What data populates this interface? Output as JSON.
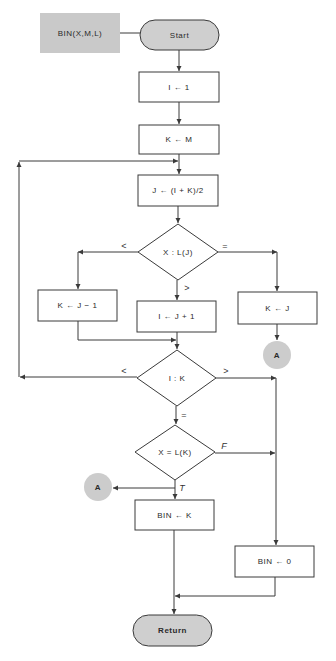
{
  "colors": {
    "line": "#3a3a3a",
    "terminal_fill": "#cfcfcf",
    "annotation_fill": "#c9c9c9",
    "connector_fill": "#cccccc",
    "box_fill": "#ffffff"
  },
  "flowchart": {
    "annotation": {
      "label": "BIN(X,M,L)"
    },
    "start": {
      "label": "Start"
    },
    "init_i": {
      "label": "I ← 1"
    },
    "init_k": {
      "label": "K ← M"
    },
    "compute_j": {
      "label": "J ← (I + K)/2"
    },
    "decision_compare": {
      "label": "X : L(J)",
      "branch_less": "<",
      "branch_greater": ">",
      "branch_equal": "="
    },
    "set_k_minus": {
      "label": "K ← J − 1"
    },
    "set_i_plus": {
      "label": "I ← J + 1"
    },
    "set_k_j": {
      "label": "K ← J"
    },
    "connector_right": {
      "label": "A"
    },
    "decision_ik": {
      "label": "I : K",
      "branch_less": "<",
      "branch_greater": ">",
      "branch_equal": "="
    },
    "decision_found": {
      "label": "X = L(K)",
      "branch_false": "F",
      "branch_true": "T"
    },
    "connector_left": {
      "label": "A"
    },
    "result_found": {
      "label": "BIN ← K"
    },
    "result_not_found": {
      "label": "BIN ← 0"
    },
    "end": {
      "label": "Return"
    }
  }
}
